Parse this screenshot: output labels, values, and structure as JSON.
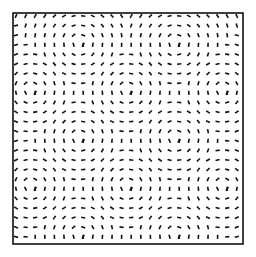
{
  "figure": {
    "frame": {
      "x": 13,
      "y": 13,
      "width": 230,
      "height": 231,
      "stroke": "#000000",
      "stroke_width": 1.5
    },
    "background": "#ffffff",
    "dash_color": "#111111",
    "dash_length": 4.2,
    "dash_width": 1.6,
    "grid_step": 9.6,
    "centers": [
      [
        80,
        43
      ],
      [
        176,
        43
      ],
      [
        31,
        90
      ],
      [
        128,
        90
      ],
      [
        223,
        90
      ],
      [
        80,
        138
      ],
      [
        176,
        138
      ],
      [
        31,
        186
      ],
      [
        128,
        186
      ],
      [
        223,
        186
      ],
      [
        80,
        235
      ],
      [
        176,
        235
      ]
    ]
  }
}
